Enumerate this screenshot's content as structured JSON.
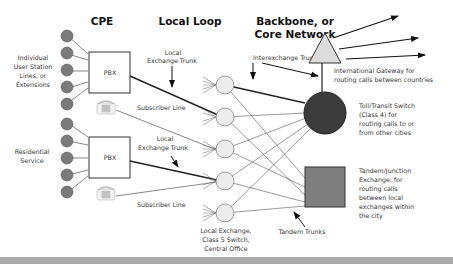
{
  "headers": {
    "cpe": "CPE",
    "local_loop": "Local Loop",
    "backbone_line1": "Backbone, or",
    "backbone_line2": "Core Network"
  },
  "labels": {
    "individual": [
      "Individual",
      "User Station",
      "Lines, or",
      "Extensions"
    ],
    "residential": [
      "Residential",
      "Service"
    ],
    "pbx_top": "PBX",
    "pbx_bottom": "PBX",
    "local_exchange_trunk_top": [
      "Local",
      "Exchange Trunk"
    ],
    "local_exchange_trunk_bottom": [
      "Local",
      "Exchange Trunk"
    ],
    "subscriber_line_top": "Subscriber Line",
    "subscriber_line_bottom": "Subscriber Line",
    "interexchange_trunks": "Interexchange Trunks",
    "international_gateway": [
      "International Gateway for",
      "routing calls between countries"
    ],
    "toll_switch": [
      "Toll/Transit Switch",
      "(Class 4) for",
      "routing calls to or",
      "from other cities"
    ],
    "tandem_exchange": [
      "Tandem/Junction",
      "Exchange: for",
      "routing calls",
      "between local",
      "exchanges within",
      "the city"
    ],
    "local_exchange": [
      "Local Exchange,",
      "Class 5 Switch,",
      "Central Office"
    ],
    "tandem_trunks": "Tandem Trunks"
  },
  "colors": {
    "station": "#7a7a7a",
    "exchange": "#ececec",
    "toll": "#3c3c3c",
    "tandem": "#7f7f7f",
    "gateway": "#dcdcdc",
    "bar": "#a9a9a9"
  },
  "icons": [
    "phone-icon-top",
    "phone-icon-bottom"
  ]
}
